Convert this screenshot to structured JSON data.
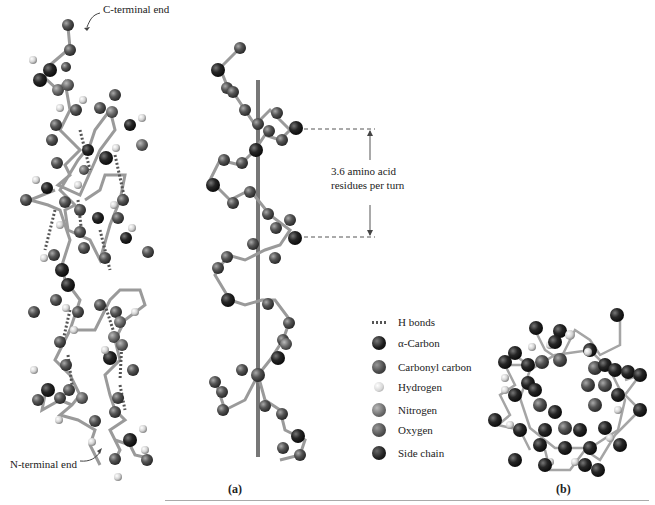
{
  "figure": {
    "panel_a_label": "(a)",
    "panel_b_label": "(b)",
    "annotations": {
      "c_terminal": "C-terminal end",
      "n_terminal": "N-terminal end",
      "turn_line1": "3.6 amino acid",
      "turn_line2": "residues per turn"
    },
    "legend": [
      {
        "label": "H bonds",
        "icon": "dotted-line-icon",
        "color": "#555555"
      },
      {
        "label": "α-Carbon",
        "icon": "sphere-icon",
        "color": "#1a1a1a"
      },
      {
        "label": "Carbonyl carbon",
        "icon": "sphere-icon",
        "color": "#4a4a4a"
      },
      {
        "label": "Hydrogen",
        "icon": "sphere-icon",
        "color": "#d8d8d8"
      },
      {
        "label": "Nitrogen",
        "icon": "sphere-icon",
        "color": "#6f6f6f"
      },
      {
        "label": "Oxygen",
        "icon": "sphere-icon",
        "color": "#555555"
      },
      {
        "label": "Side chain",
        "icon": "sphere-icon",
        "color": "#222222"
      }
    ],
    "colors": {
      "axis_rod": "#777777",
      "bond": "#9a9a9a",
      "hbond": "#555555",
      "rule": "#aaaaaa"
    }
  }
}
